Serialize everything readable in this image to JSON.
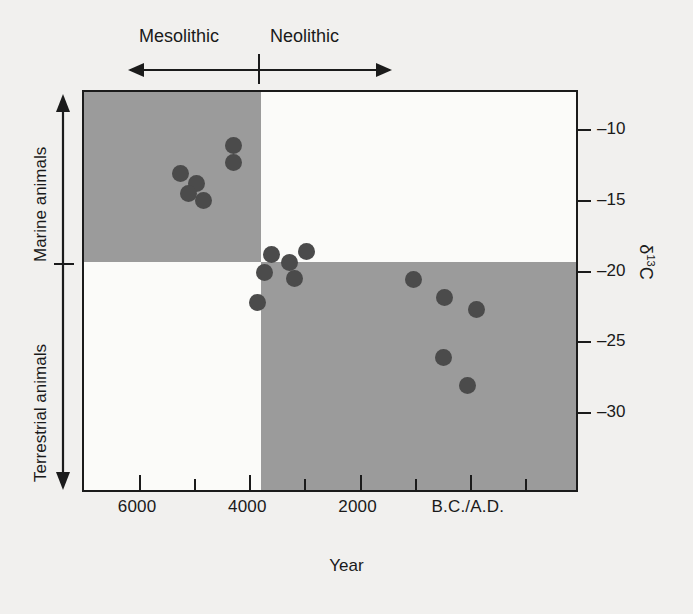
{
  "chart_data": {
    "type": "scatter",
    "title": "",
    "xlabel": "Year",
    "ylabel": "δ13C",
    "xaxis": {
      "tick_positions": [
        6000,
        5000,
        4000,
        3000,
        2000,
        1000,
        0,
        -1000
      ],
      "tick_labels": [
        "6000",
        "",
        "4000",
        "",
        "2000",
        "",
        "B.C./A.D.",
        ""
      ],
      "major_labels": [
        "6000",
        "4000",
        "2000",
        "B.C./A.D."
      ],
      "direction": "decreasing",
      "xlim": [
        7000,
        -2000
      ]
    },
    "yaxis": {
      "tick_values": [
        -10,
        -15,
        -20,
        -25,
        -30
      ],
      "tick_labels": [
        "–10",
        "–15",
        "–20",
        "–25",
        "–30"
      ],
      "ylim": [
        -7.2,
        -35.7
      ],
      "position": "right"
    },
    "grid": false,
    "legend": null,
    "shaded_quadrants": [
      {
        "name": "mesolithic-marine",
        "x_range": [
          7000,
          4000
        ],
        "y_range": [
          -7.2,
          -18.3
        ],
        "color": "#9b9b9b"
      },
      {
        "name": "neolithic-terrestrial",
        "x_range": [
          4000,
          -2000
        ],
        "y_range": [
          -18.3,
          -35.7
        ],
        "color": "#9b9b9b"
      }
    ],
    "points": [
      {
        "x": 5250,
        "y": -13.0
      },
      {
        "x": 4950,
        "y": -13.7
      },
      {
        "x": 4830,
        "y": -14.9
      },
      {
        "x": 5100,
        "y": -14.4
      },
      {
        "x": 4280,
        "y": -11.0
      },
      {
        "x": 4280,
        "y": -12.2
      },
      {
        "x": 3600,
        "y": -18.7
      },
      {
        "x": 3730,
        "y": -20.0
      },
      {
        "x": 3280,
        "y": -19.3
      },
      {
        "x": 2960,
        "y": -18.5
      },
      {
        "x": 3180,
        "y": -20.4
      },
      {
        "x": 3860,
        "y": -22.1
      },
      {
        "x": 1030,
        "y": -20.5
      },
      {
        "x": 460,
        "y": -21.8
      },
      {
        "x": -130,
        "y": -22.6
      },
      {
        "x": 480,
        "y": -26.0
      },
      {
        "x": 50,
        "y": -28.0
      }
    ],
    "marker": {
      "shape": "circle",
      "color": "#4b4b4b",
      "size": 17
    }
  },
  "period_axis": {
    "left_label": "Mesolithic",
    "right_label": "Neolithic",
    "divider_year": 4000,
    "arrow": "double-headed"
  },
  "diet_axis": {
    "top_label": "Marine animals",
    "bottom_label": "Terrestrial animals",
    "arrow": "double-headed"
  },
  "colors": {
    "background": "#f1f0ee",
    "plot_background": "#fbfbf9",
    "shade": "#9b9b9b",
    "marker": "#4b4b4b",
    "axis": "#1b1b1b"
  }
}
